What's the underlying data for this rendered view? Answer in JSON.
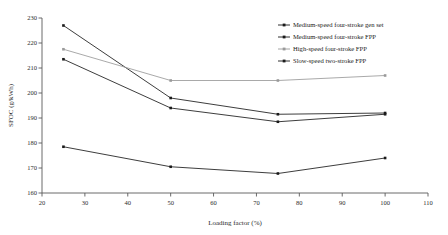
{
  "chart_data": {
    "type": "line",
    "title": "",
    "xlabel": "Loading factor (%)",
    "ylabel": "SFOC (g/kWh)",
    "xlim": [
      20,
      110
    ],
    "ylim": [
      160,
      230
    ],
    "xticks": [
      20,
      30,
      40,
      50,
      60,
      70,
      80,
      90,
      100,
      110
    ],
    "xtick_labels": [
      "20",
      "30",
      "40",
      "50",
      "60",
      "70",
      "80",
      "90",
      "100",
      "110"
    ],
    "yticks": [
      160,
      170,
      180,
      190,
      200,
      210,
      220,
      230
    ],
    "ytick_labels": [
      "160",
      "170",
      "180",
      "190",
      "200",
      "210",
      "220",
      "230"
    ],
    "grid": false,
    "legend_position": "top-right",
    "x": [
      25,
      50,
      75,
      100
    ],
    "series": [
      {
        "name": "Medium-speed four-stroke gen set",
        "color": "#1a1a1a",
        "marker": "square",
        "values": [
          227.0,
          198.0,
          191.5,
          192.0
        ]
      },
      {
        "name": "Medium-speed four-stroke FPP",
        "color": "#1a1a1a",
        "marker": "square",
        "values": [
          213.5,
          194.0,
          188.5,
          191.5
        ]
      },
      {
        "name": "High-speed four-stroke FPP",
        "color": "#9a9a9a",
        "marker": "square",
        "values": [
          217.5,
          205.0,
          205.0,
          207.0
        ]
      },
      {
        "name": "Slow-speed two-stroke FPP",
        "color": "#1a1a1a",
        "marker": "square",
        "values": [
          178.5,
          170.5,
          167.8,
          174.0
        ]
      }
    ]
  }
}
